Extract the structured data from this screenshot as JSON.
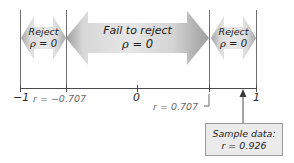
{
  "figure": {
    "type": "hypothesis-test-number-line",
    "title_text": "",
    "colors": {
      "arrow_fill_light": "#e2e2e2",
      "arrow_fill_dark": "#9d9d9d",
      "rule_gray": "#6e6e6e",
      "axis_gray": "#4a4a4a",
      "callout_bg": "#ebebeb",
      "callout_border": "#9a9a9a",
      "text_dark": "#1b1b1b",
      "text_muted": "#6a6a6a"
    }
  },
  "regions": [
    {
      "id": "reject-left",
      "line1": "Reject",
      "line2_prefix": "ρ",
      "line2_rest": " = 0",
      "kind": "reject"
    },
    {
      "id": "fail-to-reject",
      "line1": "Fail to reject",
      "line2_prefix": "ρ",
      "line2_rest": " = 0",
      "kind": "fail"
    },
    {
      "id": "reject-right",
      "line1": "Reject",
      "line2_prefix": "ρ",
      "line2_rest": " = 0",
      "kind": "reject"
    }
  ],
  "axis": {
    "min": -1,
    "max": 1,
    "ticks": [
      {
        "value": -1,
        "label": "−1",
        "style": "num"
      },
      {
        "value": -0.707,
        "label": "r = −0.707",
        "style": "crit"
      },
      {
        "value": 0,
        "label": "0",
        "style": "num"
      },
      {
        "value": 0.707,
        "label": "r = 0.707",
        "style": "crit"
      },
      {
        "value": 1,
        "label": "1",
        "style": "num"
      }
    ]
  },
  "critical_values": {
    "lower": -0.707,
    "upper": 0.707
  },
  "callout": {
    "line1": "Sample data:",
    "line2": "r = 0.926",
    "points_to_value": 0.926
  }
}
